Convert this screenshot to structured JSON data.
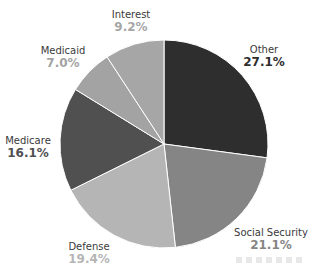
{
  "chart_data": {
    "type": "pie",
    "title": "",
    "start_angle": "top (12 o'clock)",
    "direction": "clockwise",
    "center": [
      164,
      144
    ],
    "radius": 104,
    "categories": [
      "Other",
      "Social Security",
      "Defense",
      "Medicare",
      "Medicaid",
      "Interest"
    ],
    "values": [
      27.1,
      21.1,
      19.4,
      16.1,
      7.0,
      9.2
    ],
    "value_labels": [
      "27.1%",
      "21.1%",
      "19.4%",
      "16.1%",
      "7.0%",
      "9.2%"
    ],
    "slice_colors": [
      "#2e2e2e",
      "#858585",
      "#b5b5b5",
      "#505050",
      "#a3a3a3",
      "#a6a6a6"
    ],
    "label_value_colors": [
      "#2e2e2e",
      "#858585",
      "#b5b5b5",
      "#505050",
      "#a3a3a3",
      "#a6a6a6"
    ],
    "legend": "none (direct labels)",
    "grid": false
  },
  "labels": [
    {
      "name": "Other",
      "pct": "27.1%",
      "x": 264,
      "y": 43
    },
    {
      "name": "Social Security",
      "pct": "21.1%",
      "x": 271,
      "y": 226
    },
    {
      "name": "Defense",
      "pct": "19.4%",
      "x": 89,
      "y": 240
    },
    {
      "name": "Medicare",
      "pct": "16.1%",
      "x": 28,
      "y": 134
    },
    {
      "name": "Medicaid",
      "pct": "7.0%",
      "x": 63,
      "y": 44
    },
    {
      "name": "Interest",
      "pct": "9.2%",
      "x": 131,
      "y": 8
    }
  ]
}
